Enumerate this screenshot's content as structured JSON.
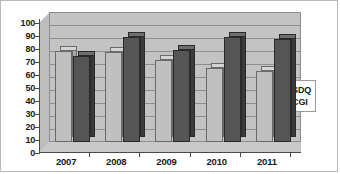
{
  "chart_data": {
    "type": "bar",
    "title": "",
    "subtitle": "",
    "xlabel": "",
    "ylabel": "",
    "categories": [
      "2007",
      "2008",
      "2009",
      "2010",
      "2011"
    ],
    "series": [
      {
        "name": "SDQ",
        "values": [
          70,
          69,
          63,
          57,
          55
        ],
        "color": "#c0c0c0"
      },
      {
        "name": "CGI",
        "values": [
          66,
          81,
          71,
          81,
          79
        ],
        "color": "#555555"
      }
    ],
    "ylim": [
      0,
      100
    ],
    "ytick_step": 10,
    "yticks": [
      "0",
      "10",
      "20",
      "30",
      "40",
      "50",
      "60",
      "70",
      "80",
      "90",
      "100"
    ],
    "grid": true,
    "grid_axis": "y",
    "legend_position": "right",
    "style": "3d-clustered-column",
    "plot_background": "#c3c3c3",
    "border_color": "#b9b9b9"
  },
  "legend": {
    "entries": [
      {
        "label": "SDQ",
        "swatch_name": "legend-swatch-sdq"
      },
      {
        "label": "CGI",
        "swatch_name": "legend-swatch-cgi"
      }
    ]
  }
}
